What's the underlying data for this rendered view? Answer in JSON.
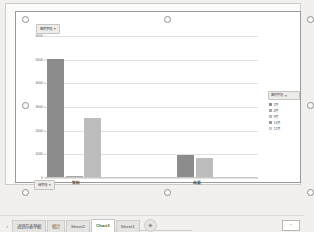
{
  "window": {
    "app": "spreadsheet-chart-sheet"
  },
  "chart_data": {
    "type": "bar",
    "title": "",
    "xlabel": "",
    "ylabel": "",
    "grid": true,
    "legend_position": "right",
    "ylim": [
      0,
      6000
    ],
    "ytick_labels": [
      "6000",
      "5000",
      "4000",
      "3000",
      "2000",
      "1000",
      "0"
    ],
    "ytick_values": [
      6000,
      5000,
      4000,
      3000,
      2000,
      1000,
      0
    ],
    "categories": [
      "饮料",
      "米面"
    ],
    "series": [
      {
        "name": "1月",
        "color": "#8c8c8c",
        "values": [
          5000,
          950
        ]
      },
      {
        "name": "4月",
        "color": "#a8a8a8",
        "values": [
          60,
          0
        ]
      },
      {
        "name": "9月",
        "color": "#bdbdbd",
        "values": [
          2500,
          800
        ]
      },
      {
        "name": "10月",
        "color": "#9a9a9a",
        "values": [
          0,
          0
        ]
      },
      {
        "name": "11月",
        "color": "#cccccc",
        "values": [
          0,
          0
        ]
      }
    ]
  },
  "chart": {
    "legend_field_button": {
      "label": "图例字段",
      "filter_icon": "filter-icon",
      "filter_glyph": "▾"
    },
    "axis_field_button": {
      "label": "轴字段",
      "filter_icon": "filter-icon",
      "filter_glyph": "▾"
    },
    "legend": {
      "header": "图例字段",
      "header_glyph": "▾",
      "items": [
        {
          "label": "1月",
          "swatch": "#8c8c8c"
        },
        {
          "label": "4月",
          "swatch": "#a8a8a8"
        },
        {
          "label": "9月",
          "swatch": "#bdbdbd"
        },
        {
          "label": "10月",
          "swatch": "#9a9a9a"
        },
        {
          "label": "11月",
          "swatch": "#cccccc"
        }
      ]
    }
  },
  "tab_bar": {
    "nav_glyph": "‹",
    "tabs": [
      {
        "label": "进销存表单据",
        "active": false
      },
      {
        "label": "统计",
        "active": false
      },
      {
        "label": "Sheet2",
        "active": false
      },
      {
        "label": "Chart1",
        "active": true
      },
      {
        "label": "Sheet1",
        "active": false
      }
    ],
    "add_sheet_glyph": "⊕",
    "scroll_right_glyph": "›"
  }
}
